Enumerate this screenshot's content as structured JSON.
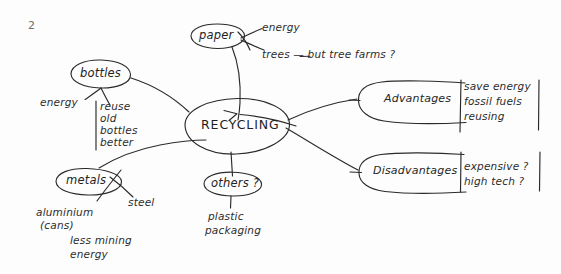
{
  "document": {
    "type": "handwritten-mind-map",
    "page_number": "2",
    "ink_color": "#2a2a2a",
    "paper_color": "#fdfdfd"
  },
  "center": {
    "label": "RECYCLING"
  },
  "nodes": {
    "paper": {
      "label": "paper",
      "details": [
        "energy",
        "trees — but tree farms ?"
      ]
    },
    "bottles": {
      "label": "bottles",
      "details": [
        "energy",
        "reuse",
        "old",
        "bottles",
        "better"
      ]
    },
    "metals": {
      "label": "metals",
      "details": [
        "steel",
        "aluminium",
        "(cans)",
        "less mining",
        "energy"
      ]
    },
    "others": {
      "label": "others ?",
      "details": [
        "plastic",
        "packaging"
      ]
    },
    "advantages": {
      "label": "Advantages",
      "details": [
        "save energy",
        "fossil fuels",
        "reusing"
      ]
    },
    "disadvantages": {
      "label": "Disadvantages",
      "details": [
        "expensive ?",
        "high tech ?"
      ]
    }
  }
}
